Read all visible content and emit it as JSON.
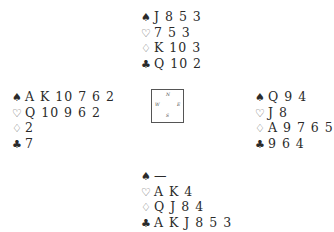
{
  "suits": {
    "spades": "♠",
    "hearts": "♡",
    "diamonds": "♢",
    "clubs": "♣"
  },
  "compass": {
    "n": "N",
    "s": "S",
    "w": "W",
    "e": "E"
  },
  "hands": {
    "north": {
      "spades": "J 8 5 3",
      "hearts": "7 5 3",
      "diamonds": "K 10 3",
      "clubs": "Q 10 2"
    },
    "west": {
      "spades": "A K 10 7 6 2",
      "hearts": "Q 10 9 6 2",
      "diamonds": "2",
      "clubs": "7"
    },
    "east": {
      "spades": "Q 9 4",
      "hearts": "J 8",
      "diamonds": "A 9 7 6 5",
      "clubs": "9 6 4"
    },
    "south": {
      "spades": "—",
      "hearts": "A K 4",
      "diamonds": "Q J 8 4",
      "clubs": "A K J 8 5 3"
    }
  }
}
